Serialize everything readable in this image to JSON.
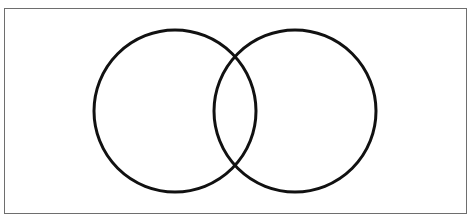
{
  "caption": {
    "text": "",
    "note": "cropped caption descenders visible at top edge"
  },
  "diagram": {
    "type": "venn",
    "frame": {
      "x": 4,
      "y": 8,
      "width": 463,
      "height": 206,
      "border_color": "#6e6e6e"
    },
    "stroke_color": "#111111",
    "stroke_width": 3,
    "circles": [
      {
        "id": "left",
        "cx": 175,
        "cy": 111,
        "r": 81,
        "label": ""
      },
      {
        "id": "right",
        "cx": 295,
        "cy": 111,
        "r": 81,
        "label": ""
      }
    ]
  }
}
